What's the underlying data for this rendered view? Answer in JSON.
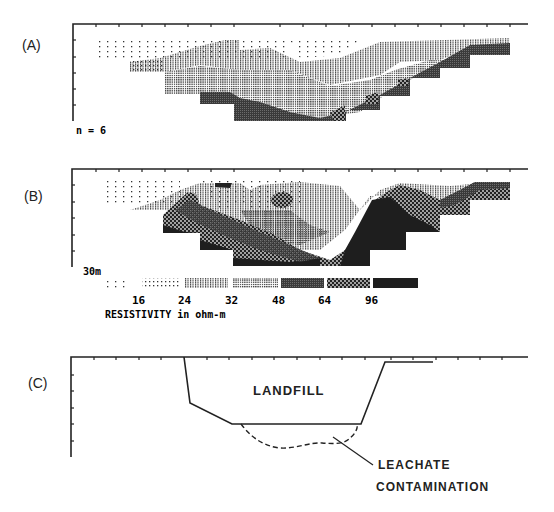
{
  "figure": {
    "panels": [
      {
        "id": "A",
        "label": "(A)",
        "annotation": "n = 6"
      },
      {
        "id": "B",
        "label": "(B)",
        "annotation": "30m"
      },
      {
        "id": "C",
        "label": "(C)",
        "landfill_label": "LANDFILL",
        "leachate_label_line1": "LEACHATE",
        "leachate_label_line2": "CONTAMINATION"
      }
    ],
    "legend": {
      "title": "RESISTIVITY in ohm-m",
      "tick_labels": [
        "16",
        "24",
        "32",
        "48",
        "64",
        "96"
      ],
      "swatches": [
        {
          "pattern": "sparse-dots",
          "range": "<16"
        },
        {
          "pattern": "dense-dots",
          "range": "16-24"
        },
        {
          "pattern": "vertical-lines",
          "range": "24-32"
        },
        {
          "pattern": "grid",
          "range": "32-48"
        },
        {
          "pattern": "dark-stipple",
          "range": "48-64"
        },
        {
          "pattern": "hex-dots",
          "range": "64-96"
        },
        {
          "pattern": "solid-dark",
          "range": ">96"
        }
      ]
    },
    "colors": {
      "ink": "#111111",
      "dark": "#1e1e1e",
      "stipple": "#3a3a3a"
    }
  }
}
